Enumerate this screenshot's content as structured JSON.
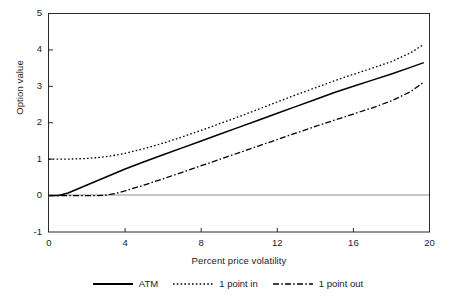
{
  "chart_data": {
    "type": "line",
    "title": "",
    "xlabel": "Percent price volatility",
    "ylabel": "Option value",
    "xlim": [
      0,
      20
    ],
    "ylim": [
      -1,
      5
    ],
    "xticks": [
      0,
      4,
      8,
      12,
      16,
      20
    ],
    "yticks": [
      -1,
      0,
      1,
      2,
      3,
      4,
      5
    ],
    "xtick_labels": [
      "0",
      "4",
      "8",
      "12",
      "16",
      "20"
    ],
    "ytick_labels": [
      "5",
      "4",
      "3",
      "2",
      "1",
      "0",
      "-1"
    ],
    "grid": false,
    "zero_line": true,
    "legend_position": "below",
    "x": [
      0,
      0.5,
      1,
      1.5,
      2,
      2.5,
      3,
      3.5,
      4,
      5,
      6,
      7,
      8,
      9,
      10,
      11,
      12,
      13,
      14,
      15,
      16,
      17,
      18,
      19,
      19.7
    ],
    "series": [
      {
        "name": "ATM",
        "style": "solid",
        "color": "#000000",
        "values": [
          0,
          0,
          0.07,
          0.18,
          0.29,
          0.4,
          0.51,
          0.62,
          0.73,
          0.93,
          1.12,
          1.31,
          1.5,
          1.69,
          1.88,
          2.07,
          2.26,
          2.45,
          2.64,
          2.83,
          3.0,
          3.17,
          3.34,
          3.52,
          3.65
        ]
      },
      {
        "name": "1 point in",
        "style": "dotted",
        "color": "#000000",
        "values": [
          1.0,
          1.0,
          1.0,
          1.01,
          1.02,
          1.04,
          1.07,
          1.11,
          1.16,
          1.29,
          1.44,
          1.61,
          1.79,
          1.98,
          2.17,
          2.37,
          2.57,
          2.77,
          2.96,
          3.15,
          3.33,
          3.5,
          3.68,
          3.92,
          4.15
        ]
      },
      {
        "name": "1 point out",
        "style": "dashdot",
        "color": "#000000",
        "values": [
          0,
          0,
          0,
          0,
          0,
          0,
          0.01,
          0.06,
          0.13,
          0.29,
          0.46,
          0.64,
          0.82,
          1.0,
          1.18,
          1.36,
          1.54,
          1.72,
          1.9,
          2.07,
          2.24,
          2.41,
          2.6,
          2.85,
          3.12
        ]
      }
    ]
  },
  "axes": {
    "ylabel": "Option value",
    "xlabel": "Percent price volatility"
  },
  "legend": {
    "items": [
      {
        "label": "ATM",
        "style": "solid"
      },
      {
        "label": "1 point in",
        "style": "dotted"
      },
      {
        "label": "1 point out",
        "style": "dashdot"
      }
    ]
  },
  "colors": {
    "line": "#000000",
    "frame": "#2a2a2a",
    "zero_line": "#8d8d8d",
    "text": "#1c1c1c",
    "background": "#ffffff"
  }
}
